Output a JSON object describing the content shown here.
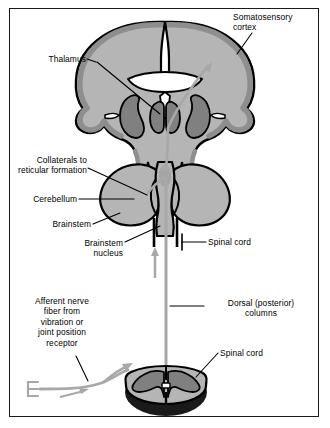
{
  "figure": {
    "background_color": "#ffffff",
    "border_color": "#1a1a1a"
  },
  "palette": {
    "outline": "#000000",
    "cortex_gray": "#8e8e8e",
    "tissue_light": "#b5b5b5",
    "tissue_mid": "#9a9a9a",
    "tissue_dark": "#7a7a7a",
    "nucleus_dark": "#808080",
    "pathway_gray": "#a8a8a8",
    "white_fill": "#ffffff",
    "leader_line": "#000000",
    "text": "#000000"
  },
  "labels": [
    {
      "id": "somatosensory-cortex",
      "text": "Somatosensory\ncortex",
      "align": "left",
      "x": 233,
      "y": 12
    },
    {
      "id": "thalamus",
      "text": "Thalamus",
      "align": "right",
      "x": 41,
      "y": 55
    },
    {
      "id": "collaterals-reticular-formation",
      "text": "Collaterals to\nreticular formation",
      "align": "right",
      "x": 12,
      "y": 156
    },
    {
      "id": "cerebellum",
      "text": "Cerebellum",
      "align": "right",
      "x": 34,
      "y": 196
    },
    {
      "id": "brainstem",
      "text": "Brainstem",
      "align": "right",
      "x": 60,
      "y": 221
    },
    {
      "id": "brainstem-nucleus",
      "text": "Brainstem\nnucleus",
      "align": "right",
      "x": 84,
      "y": 240
    },
    {
      "id": "spinal-cord-upper",
      "text": "Spinal cord",
      "align": "left",
      "x": 208,
      "y": 238
    },
    {
      "id": "dorsal-posterior-columns",
      "text": "Dorsal (posterior)\ncolumns",
      "align": "left",
      "x": 206,
      "y": 298
    },
    {
      "id": "afferent-nerve-fiber",
      "text": "Afferent nerve\nfiber from\nvibration or\njoint position\nreceptor",
      "align": "center",
      "x": 27,
      "y": 296
    },
    {
      "id": "spinal-cord-lower",
      "text": "Spinal cord",
      "align": "left",
      "x": 220,
      "y": 349
    }
  ],
  "structures": [
    {
      "id": "cerebral-hemispheres",
      "name": "Cerebral hemispheres coronal section"
    },
    {
      "id": "cerebral-cortex-band",
      "name": "Cerebral cortex gray matter band"
    },
    {
      "id": "lateral-ventricles",
      "name": "Lateral ventricles"
    },
    {
      "id": "third-ventricle",
      "name": "Third ventricle"
    },
    {
      "id": "thalamus-nuclei",
      "name": "Thalamic nuclei"
    },
    {
      "id": "basal-ganglia",
      "name": "Basal ganglia"
    },
    {
      "id": "cerebellum-body",
      "name": "Cerebellum"
    },
    {
      "id": "brainstem-body",
      "name": "Brainstem"
    },
    {
      "id": "brainstem-nucleus-body",
      "name": "Brainstem nucleus"
    },
    {
      "id": "spinal-cord-column",
      "name": "Spinal cord column"
    },
    {
      "id": "spinal-cord-section",
      "name": "Spinal cord cross section"
    },
    {
      "id": "spinal-gray-matter",
      "name": "Spinal gray matter butterfly"
    },
    {
      "id": "central-canal",
      "name": "Central canal"
    }
  ],
  "pathway": {
    "name": "dorsal-column-medial-lemniscus-pathway",
    "color": "#a8a8a8",
    "arrows": [
      {
        "id": "arrow-cortex",
        "direction": "up-right",
        "location": "cerebral hemisphere toward somatosensory cortex"
      },
      {
        "id": "arrow-brainstem",
        "direction": "up",
        "location": "brainstem ascending"
      },
      {
        "id": "arrow-spinal",
        "direction": "up",
        "location": "dorsal column ascending"
      },
      {
        "id": "arrow-afferent",
        "direction": "right",
        "location": "afferent fiber entering spinal cord"
      },
      {
        "id": "arrow-dorsal-root",
        "direction": "up-right",
        "location": "dorsal root entry"
      }
    ],
    "receptor": {
      "id": "receptor-terminal",
      "shape": "comb",
      "prongs": 3
    }
  }
}
